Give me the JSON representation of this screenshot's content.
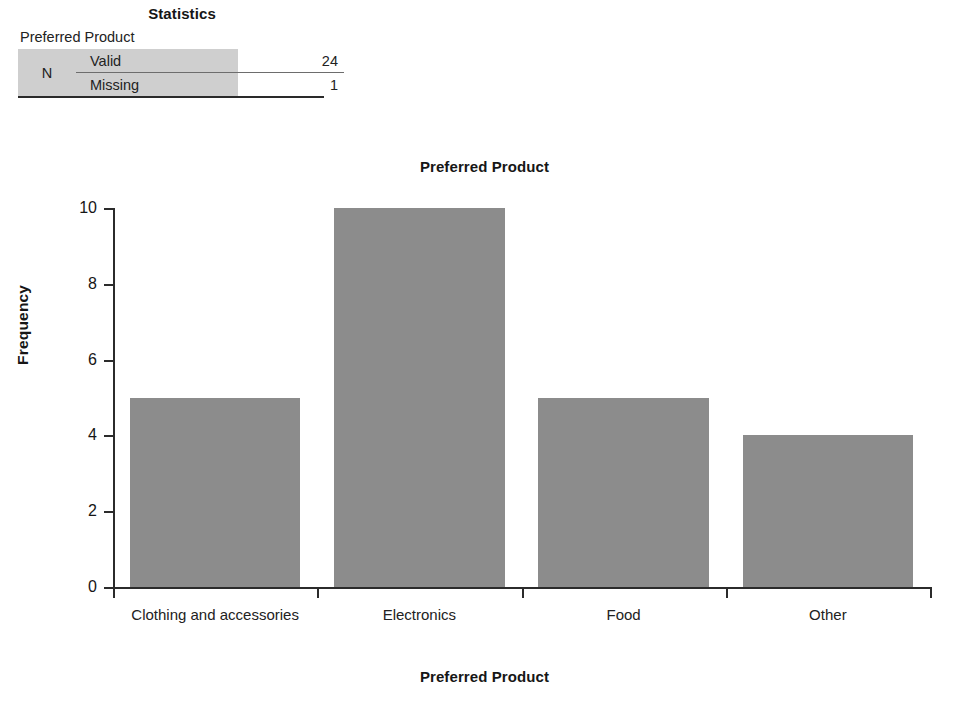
{
  "stats_table": {
    "title": "Statistics",
    "subtitle": "Preferred Product",
    "row_group_label": "N",
    "rows": [
      {
        "label": "Valid",
        "value": "24"
      },
      {
        "label": "Missing",
        "value": "1"
      }
    ]
  },
  "chart_data": {
    "type": "bar",
    "title": "Preferred Product",
    "xlabel": "Preferred Product",
    "ylabel": "Frequency",
    "categories": [
      "Clothing and accessories",
      "Electronics",
      "Food",
      "Other"
    ],
    "values": [
      5,
      10,
      5,
      4
    ],
    "ytick_labels": [
      "0",
      "2",
      "4",
      "6",
      "8",
      "10"
    ],
    "ytick_values": [
      0,
      2,
      4,
      6,
      8,
      10
    ],
    "ylim": [
      0,
      10
    ],
    "grid": false,
    "legend": "none",
    "bar_color": "#8c8c8c",
    "axis_color": "#2b2b2b"
  }
}
